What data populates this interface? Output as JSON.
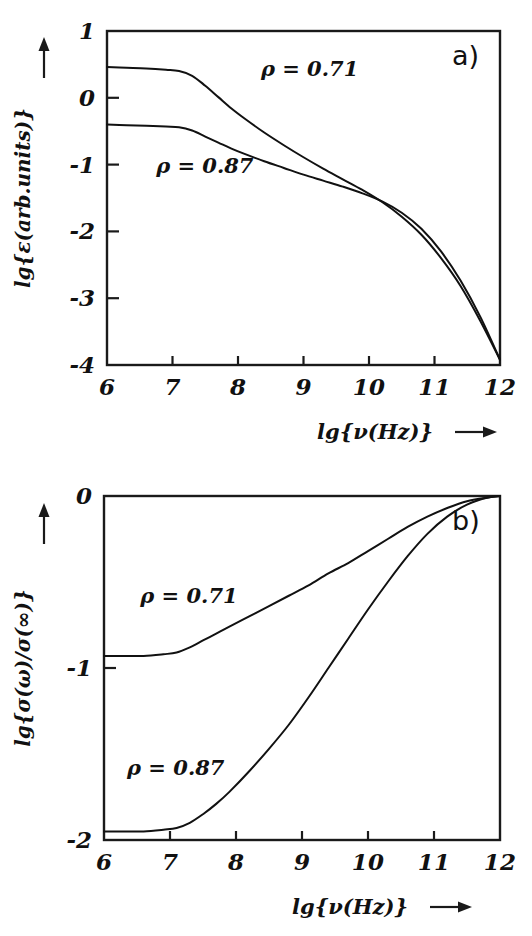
{
  "figure": {
    "background": "#ffffff",
    "ink_color": "#111111",
    "panels": [
      "a)",
      "b)"
    ]
  },
  "chart_data": [
    {
      "type": "line",
      "panel_label": "a)",
      "title": "",
      "xlabel": "lg{ν(Hz)}",
      "ylabel": "lg{ε(arb.units)}",
      "xlim": [
        6,
        12
      ],
      "ylim": [
        -4,
        1
      ],
      "xticks": [
        6,
        7,
        8,
        9,
        10,
        11,
        12
      ],
      "xticklabels": [
        "6",
        "7",
        "8",
        "9",
        "10",
        "11",
        "12"
      ],
      "yticks": [
        1,
        0,
        -1,
        -2,
        -3,
        -4
      ],
      "yticklabels": [
        "1",
        "0",
        "-1",
        "-2",
        "-3",
        "-4"
      ],
      "grid": false,
      "legend_position": "inline-annotations",
      "x_axis_arrow": true,
      "y_axis_arrow": true,
      "series": [
        {
          "name": "ρ = 0.71",
          "label_text": "ρ = 0.71",
          "label_x": 8.35,
          "label_y": 0.33,
          "x": [
            6.0,
            6.3,
            6.6,
            6.9,
            7.1,
            7.3,
            7.5,
            7.7,
            7.9,
            8.1,
            8.4,
            8.7,
            9.0,
            9.3,
            9.6,
            9.9,
            10.2,
            10.5,
            10.8,
            11.1,
            11.4,
            11.7,
            12.0
          ],
          "values": [
            0.46,
            0.45,
            0.44,
            0.42,
            0.4,
            0.33,
            0.18,
            0.01,
            -0.16,
            -0.31,
            -0.52,
            -0.71,
            -0.89,
            -1.06,
            -1.22,
            -1.38,
            -1.56,
            -1.78,
            -2.05,
            -2.4,
            -2.82,
            -3.34,
            -3.92
          ]
        },
        {
          "name": "ρ = 0.87",
          "label_text": "ρ = 0.87",
          "label_x": 6.75,
          "label_y": -1.12,
          "x": [
            6.0,
            6.3,
            6.6,
            6.9,
            7.1,
            7.3,
            7.5,
            7.7,
            7.9,
            8.1,
            8.4,
            8.7,
            9.0,
            9.3,
            9.6,
            9.9,
            10.2,
            10.5,
            10.8,
            11.1,
            11.4,
            11.7,
            12.0
          ],
          "values": [
            -0.4,
            -0.41,
            -0.42,
            -0.43,
            -0.44,
            -0.49,
            -0.58,
            -0.67,
            -0.76,
            -0.84,
            -0.95,
            -1.05,
            -1.15,
            -1.24,
            -1.33,
            -1.43,
            -1.55,
            -1.72,
            -1.96,
            -2.3,
            -2.74,
            -3.28,
            -3.92
          ]
        }
      ]
    },
    {
      "type": "line",
      "panel_label": "b)",
      "title": "",
      "xlabel": "lg{ν(Hz)}",
      "ylabel": "lg{σ(ω)/σ(∞)}",
      "xlim": [
        6,
        12
      ],
      "ylim": [
        -2,
        0
      ],
      "xticks": [
        6,
        7,
        8,
        9,
        10,
        11,
        12
      ],
      "xticklabels": [
        "6",
        "7",
        "8",
        "9",
        "10",
        "11",
        "12"
      ],
      "yticks": [
        0,
        -1,
        -2
      ],
      "yticklabels": [
        "0",
        "-1",
        "-2"
      ],
      "grid": false,
      "legend_position": "inline-annotations",
      "x_axis_arrow": true,
      "y_axis_arrow": true,
      "series": [
        {
          "name": "ρ = 0.71",
          "label_text": "ρ = 0.71",
          "label_x": 6.55,
          "label_y": -0.62,
          "x": [
            6.0,
            6.3,
            6.6,
            6.9,
            7.1,
            7.3,
            7.5,
            7.7,
            7.9,
            8.2,
            8.5,
            8.8,
            9.1,
            9.4,
            9.7,
            10.0,
            10.3,
            10.6,
            10.9,
            11.2,
            11.5,
            11.8,
            12.0
          ],
          "values": [
            -0.93,
            -0.93,
            -0.93,
            -0.92,
            -0.91,
            -0.88,
            -0.84,
            -0.8,
            -0.76,
            -0.7,
            -0.64,
            -0.58,
            -0.52,
            -0.45,
            -0.39,
            -0.32,
            -0.25,
            -0.18,
            -0.12,
            -0.07,
            -0.03,
            -0.01,
            0.0
          ]
        },
        {
          "name": "ρ = 0.87",
          "label_text": "ρ = 0.87",
          "label_x": 6.35,
          "label_y": -1.62,
          "x": [
            6.0,
            6.3,
            6.6,
            6.9,
            7.1,
            7.3,
            7.5,
            7.7,
            7.9,
            8.2,
            8.5,
            8.8,
            9.1,
            9.4,
            9.7,
            10.0,
            10.3,
            10.6,
            10.9,
            11.2,
            11.5,
            11.8,
            12.0
          ],
          "values": [
            -1.95,
            -1.95,
            -1.95,
            -1.94,
            -1.93,
            -1.9,
            -1.85,
            -1.79,
            -1.72,
            -1.6,
            -1.47,
            -1.33,
            -1.17,
            -1.0,
            -0.83,
            -0.66,
            -0.5,
            -0.35,
            -0.22,
            -0.12,
            -0.05,
            -0.01,
            0.0
          ]
        }
      ]
    }
  ]
}
